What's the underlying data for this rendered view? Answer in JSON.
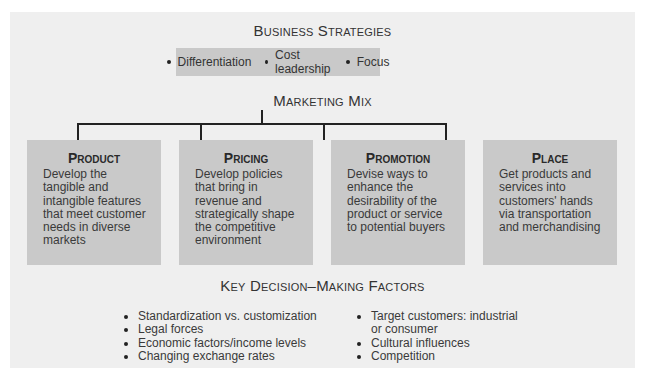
{
  "business_strategies": {
    "title": "Business Strategies",
    "items": [
      "Differentiation",
      "Cost leadership",
      "Focus"
    ]
  },
  "marketing_mix": {
    "title": "Marketing Mix",
    "boxes": [
      {
        "heading": "Product",
        "description": "Develop the tangible and intangible features that meet customer needs in diverse markets"
      },
      {
        "heading": "Pricing",
        "description": "Develop policies that bring in revenue and strategically shape the competitive environment"
      },
      {
        "heading": "Promotion",
        "description": "Devise ways to enhance the desirability of the product or service to potential buyers"
      },
      {
        "heading": "Place",
        "description": "Get products and services into customers' hands via transportation and merchandising"
      }
    ]
  },
  "key_factors": {
    "title": "Key Decision–Making Factors",
    "left": [
      "Standardization vs. customization",
      "Legal forces",
      "Economic factors/income levels",
      "Changing exchange rates"
    ],
    "right": [
      "Target customers: industrial or consumer",
      "Cultural influences",
      "Competition"
    ]
  },
  "colors": {
    "panel": "#efefef",
    "box": "#c9c9c9",
    "line": "#222222"
  }
}
